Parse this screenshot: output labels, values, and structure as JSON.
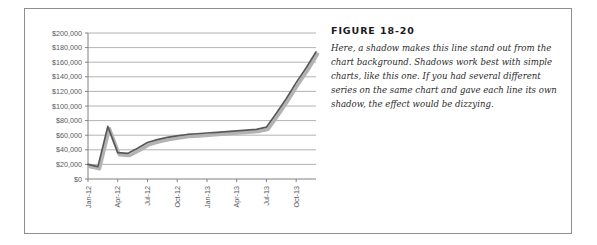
{
  "figure": {
    "label": "FIGURE 18-20",
    "caption": "Here, a shadow makes this line stand out from the chart background. Shadows work best with simple charts, like this one. If you had several different series on the same chart and gave each line its own shadow, the effect would be dizzying."
  },
  "colors": {
    "line": "#585858",
    "shadow": "#b3b3b3",
    "gridline": "#9e9e9e",
    "axis": "#808080",
    "tick_text": "#595959",
    "frame": "#8e8e8e",
    "plot_background": "#ffffff"
  },
  "chart_data": {
    "type": "line",
    "title": "",
    "subtitle": "",
    "xlabel": "",
    "ylabel": "",
    "grid": true,
    "legend": false,
    "legend_position": "none",
    "ylim": [
      0,
      200000
    ],
    "ytick_labels": [
      "$200,000",
      "$180,000",
      "$160,000",
      "$140,000",
      "$120,000",
      "$100,000",
      "$80,000",
      "$60,000",
      "$40,000",
      "$20,000",
      "$0"
    ],
    "ytick_values": [
      200000,
      180000,
      160000,
      140000,
      120000,
      100000,
      80000,
      60000,
      40000,
      20000,
      0
    ],
    "xtick_labels": [
      "Jan-12",
      "Apr-12",
      "Jul-12",
      "Oct-12",
      "Jan-13",
      "Apr-13",
      "Jul-13",
      "Oct-13"
    ],
    "xtick_label_rotation": -90,
    "x": [
      "Jan-12",
      "Feb-12",
      "Mar-12",
      "Apr-12",
      "May-12",
      "Jun-12",
      "Jul-12",
      "Aug-12",
      "Sep-12",
      "Oct-12",
      "Nov-12",
      "Dec-12",
      "Jan-13",
      "Feb-13",
      "Mar-13",
      "Apr-13",
      "May-13",
      "Jun-13",
      "Jul-13",
      "Aug-13",
      "Sep-13",
      "Oct-13",
      "Nov-13",
      "Dec-13"
    ],
    "series": [
      {
        "name": "Series 1",
        "style": "line-with-shadow",
        "values": [
          20000,
          17000,
          72000,
          36000,
          35000,
          42000,
          50000,
          54000,
          57000,
          59000,
          61000,
          62000,
          63000,
          64000,
          65000,
          66000,
          67000,
          68000,
          71000,
          90000,
          110000,
          132000,
          152000,
          174000
        ]
      }
    ]
  }
}
